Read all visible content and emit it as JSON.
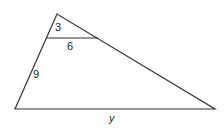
{
  "diagram": {
    "type": "triangle-with-parallel-segment",
    "stroke_color": "#333333",
    "vertices": {
      "apex": [
        57,
        14
      ],
      "bottom_left": [
        15,
        109
      ],
      "bottom_right": [
        215,
        109
      ]
    },
    "inner_segment": {
      "from": [
        47,
        38
      ],
      "to": [
        98,
        38
      ]
    },
    "labels": {
      "upper_side": "3",
      "inner_segment": "6",
      "lower_side": "9",
      "base": "y"
    }
  }
}
